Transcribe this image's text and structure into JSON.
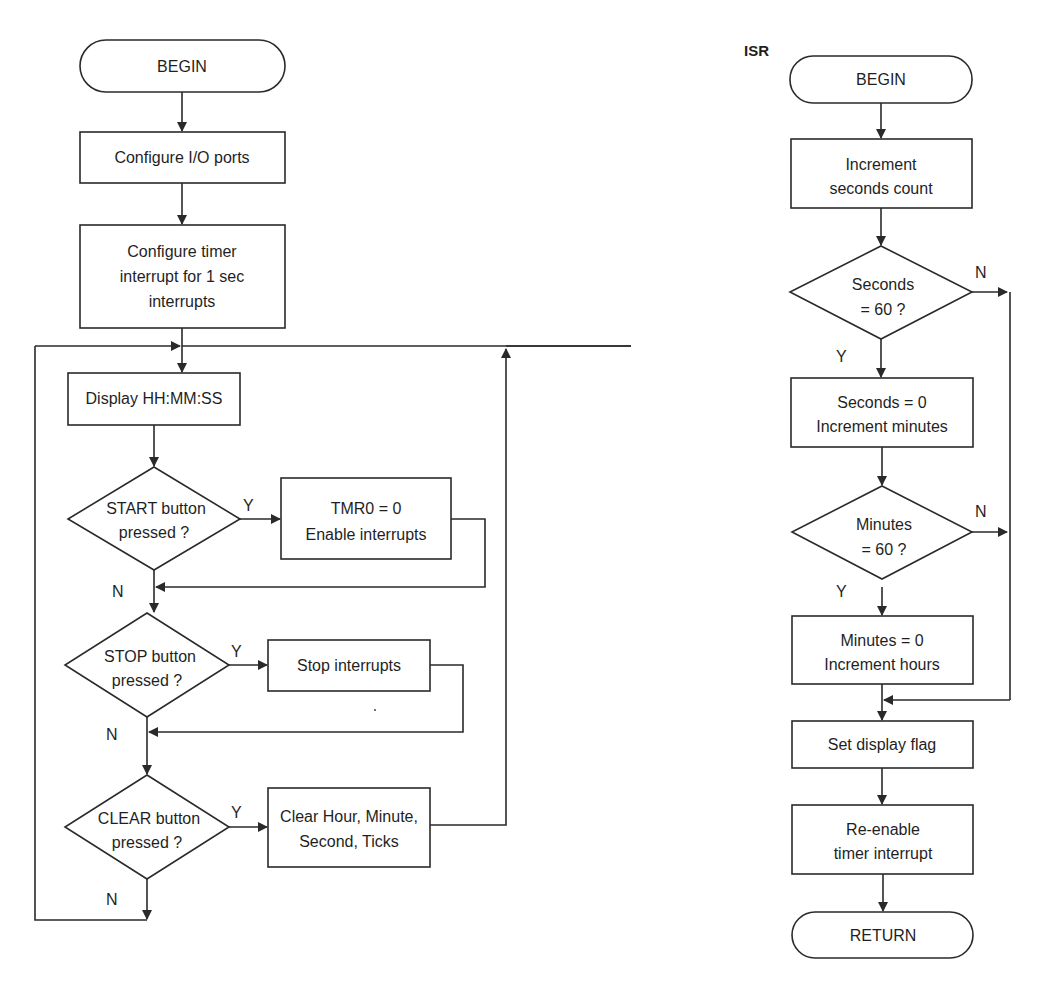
{
  "main_flow": {
    "begin": "BEGIN",
    "config_io": "Configure I/O ports",
    "config_timer": [
      "Configure timer",
      "interrupt for 1 sec",
      "interrupts"
    ],
    "display": "Display HH:MM:SS",
    "start_decision": [
      "START button",
      "pressed ?"
    ],
    "start_action": [
      "TMR0 = 0",
      "Enable interrupts"
    ],
    "stop_decision": [
      "STOP button",
      "pressed ?"
    ],
    "stop_action": "Stop interrupts",
    "clear_decision": [
      "CLEAR button",
      "pressed ?"
    ],
    "clear_action": [
      "Clear Hour, Minute,",
      "Second, Ticks"
    ],
    "yes": "Y",
    "no": "N"
  },
  "isr_flow": {
    "title": "ISR",
    "begin": "BEGIN",
    "inc_seconds": [
      "Increment",
      "seconds count"
    ],
    "seconds_decision": [
      "Seconds",
      "= 60 ?"
    ],
    "seconds_action": [
      "Seconds = 0",
      "Increment minutes"
    ],
    "minutes_decision": [
      "Minutes",
      "= 60 ?"
    ],
    "minutes_action": [
      "Minutes = 0",
      "Increment hours"
    ],
    "set_flag": "Set display flag",
    "reenable": [
      "Re-enable",
      "timer interrupt"
    ],
    "return": "RETURN",
    "yes": "Y",
    "no": "N"
  },
  "caption": "Figure 5.100   Flow diagram of Project 32"
}
